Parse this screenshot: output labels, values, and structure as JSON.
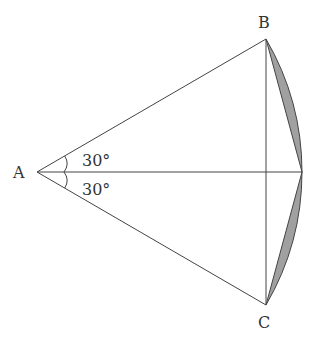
{
  "diagram": {
    "type": "geometry-sector",
    "points": {
      "A": {
        "label": "A",
        "x": 37,
        "y": 172
      },
      "B": {
        "label": "B",
        "x": 266,
        "y": 39
      },
      "C": {
        "label": "C",
        "x": 266,
        "y": 305
      },
      "M": {
        "label": "",
        "x": 302,
        "y": 172
      }
    },
    "angles": [
      {
        "label": "30°",
        "between": [
          "AB",
          "AM"
        ]
      },
      {
        "label": "30°",
        "between": [
          "AM",
          "AC"
        ]
      }
    ],
    "colors": {
      "line": "#444444",
      "shade": "#a0a0a0"
    }
  }
}
